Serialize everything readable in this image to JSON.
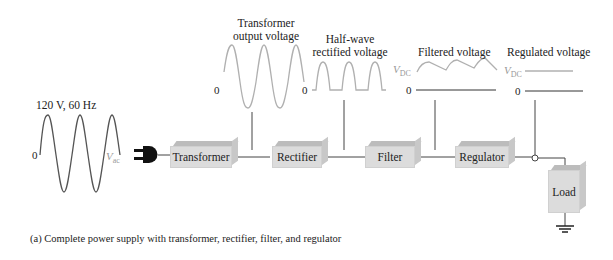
{
  "diagram": {
    "source": {
      "label": "120 V, 60 Hz",
      "zero_label": "0",
      "vac_label": "V",
      "vac_sub": "ac"
    },
    "blocks": [
      {
        "id": "transformer",
        "label": "Transformer"
      },
      {
        "id": "rectifier",
        "label": "Rectifier"
      },
      {
        "id": "filter",
        "label": "Filter"
      },
      {
        "id": "regulator",
        "label": "Regulator"
      },
      {
        "id": "load",
        "label": "Load"
      }
    ],
    "waveforms": [
      {
        "id": "transformer-output",
        "title_line1": "Transformer",
        "title_line2": "output voltage",
        "zero_label": "0"
      },
      {
        "id": "half-wave",
        "title_line1": "Half-wave",
        "title_line2": "rectified voltage",
        "zero_label": "0"
      },
      {
        "id": "filtered",
        "title_line1": "Filtered voltage",
        "zero_label": "0",
        "vdc_label": "V",
        "vdc_sub": "DC"
      },
      {
        "id": "regulated",
        "title_line1": "Regulated voltage",
        "zero_label": "0",
        "vdc_label": "V",
        "vdc_sub": "DC"
      }
    ],
    "caption": "(a)  Complete power supply with transformer, rectifier, filter, and regulator",
    "colors": {
      "waveform": "#b0b0b0",
      "wire": "#444444",
      "block_face": "#dcdcdc",
      "block_top": "#bcbcbc"
    }
  }
}
